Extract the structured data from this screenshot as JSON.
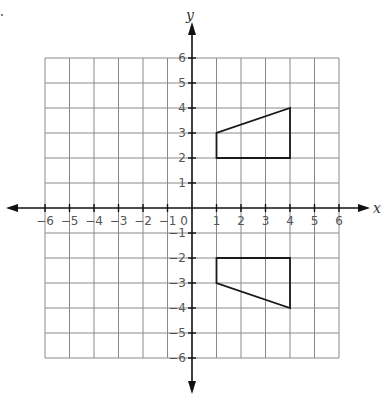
{
  "chart_data": {
    "type": "scatter",
    "title": "",
    "xlabel": "x",
    "ylabel": "y",
    "xlim": [
      -6,
      6
    ],
    "ylim": [
      -6,
      6
    ],
    "grid": true,
    "x_ticks": [
      -6,
      -5,
      -4,
      -3,
      -2,
      -1,
      0,
      1,
      2,
      3,
      4,
      5,
      6
    ],
    "y_ticks": [
      -6,
      -5,
      -4,
      -3,
      -2,
      -1,
      1,
      2,
      3,
      4,
      5,
      6
    ],
    "x_tick_labels": [
      "−6",
      "−5",
      "−4",
      "−3",
      "−2",
      "−1",
      "0",
      "1",
      "2",
      "3",
      "4",
      "5",
      "6"
    ],
    "y_tick_labels": [
      "−6",
      "−5",
      "−4",
      "−3",
      "−2",
      "−1",
      "1",
      "2",
      "3",
      "4",
      "5",
      "6"
    ],
    "series": [
      {
        "name": "Quadrilateral (Quadrant I)",
        "kind": "polygon",
        "points": [
          [
            1,
            2
          ],
          [
            1,
            3
          ],
          [
            4,
            4
          ],
          [
            4,
            2
          ]
        ]
      },
      {
        "name": "Quadrilateral (Quadrant IV)",
        "kind": "polygon",
        "points": [
          [
            1,
            -2
          ],
          [
            1,
            -3
          ],
          [
            4,
            -4
          ],
          [
            4,
            -2
          ]
        ]
      }
    ],
    "legend": null
  },
  "labels": {
    "x_axis": "x",
    "y_axis": "y",
    "origin": "0"
  }
}
